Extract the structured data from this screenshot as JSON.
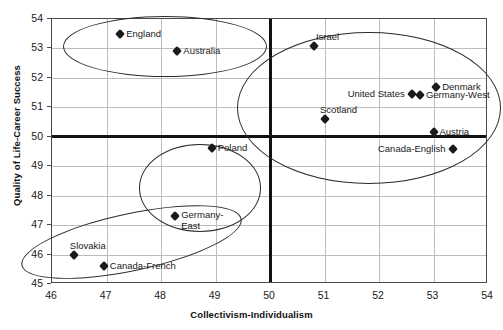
{
  "chart_data": {
    "type": "scatter",
    "title": "",
    "xlabel": "Collectivism-Individualism",
    "ylabel": "Quality of Life-Career Success",
    "xlim": [
      46,
      54
    ],
    "ylim": [
      45,
      54
    ],
    "xticks": [
      "46",
      "47",
      "48",
      "49",
      "50",
      "51",
      "52",
      "53",
      "54"
    ],
    "yticks": [
      "45",
      "46",
      "47",
      "48",
      "49",
      "50",
      "51",
      "52",
      "53",
      "54"
    ],
    "grid": "horizontal-and-vertical-light",
    "legend": "none",
    "reference_lines": [
      {
        "axis": "x",
        "value": 50
      },
      {
        "axis": "y",
        "value": 50
      }
    ],
    "points": [
      {
        "label": "England",
        "x": 47.25,
        "y": 53.5,
        "label_pos": "right"
      },
      {
        "label": "Australia",
        "x": 48.3,
        "y": 52.9,
        "label_pos": "right"
      },
      {
        "label": "Israel",
        "x": 50.8,
        "y": 53.1,
        "label_pos": "above-right"
      },
      {
        "label": "Denmark",
        "x": 53.05,
        "y": 51.7,
        "label_pos": "right"
      },
      {
        "label": "United States",
        "x": 52.6,
        "y": 51.45,
        "label_pos": "left"
      },
      {
        "label": "Germany-West",
        "x": 52.75,
        "y": 51.42,
        "label_pos": "right"
      },
      {
        "label": "Scotland",
        "x": 51.0,
        "y": 50.6,
        "label_pos": "above-right"
      },
      {
        "label": "Austria",
        "x": 53.0,
        "y": 50.15,
        "label_pos": "right"
      },
      {
        "label": "Canada-English",
        "x": 53.35,
        "y": 49.6,
        "label_pos": "left"
      },
      {
        "label": "Poland",
        "x": 48.93,
        "y": 49.63,
        "label_pos": "right"
      },
      {
        "label": "Germany-\nEast",
        "x": 48.26,
        "y": 47.3,
        "label_pos": "right"
      },
      {
        "label": "Slovakia",
        "x": 46.4,
        "y": 46.0,
        "label_pos": "above-right"
      },
      {
        "label": "Canada-French",
        "x": 46.95,
        "y": 45.62,
        "label_pos": "right"
      }
    ],
    "clusters": [
      {
        "name": "english-speaking-cluster",
        "cx": 48.05,
        "cy": 53.1,
        "rx": 1.85,
        "ry": 1.0,
        "rotation": 0
      },
      {
        "name": "western-individualist-cluster",
        "cx": 51.8,
        "cy": 51.0,
        "rx": 2.4,
        "ry": 2.55,
        "rotation": 0
      },
      {
        "name": "central-european-cluster",
        "cx": 48.7,
        "cy": 48.3,
        "rx": 1.1,
        "ry": 1.45,
        "rotation": 0
      },
      {
        "name": "slavic-french-cluster",
        "cx": 47.45,
        "cy": 46.45,
        "rx": 2.05,
        "ry": 0.95,
        "rotation": -12
      }
    ],
    "colors": {
      "marker": "#1a1a1a",
      "grid": "#bdbdbd",
      "frame": "#4a4a4a",
      "reference_line": "#111111",
      "background": "#ffffff"
    }
  }
}
